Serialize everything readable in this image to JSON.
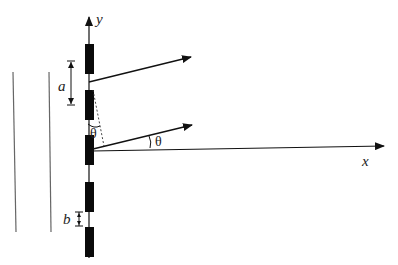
{
  "diagram": {
    "type": "diffraction-grating-geometry",
    "axes": {
      "x_label": "x",
      "y_label": "y"
    },
    "labels": {
      "slit_spacing": "a",
      "slit_width": "b",
      "angle_incident": "θ",
      "angle_between": "θ"
    },
    "slits": {
      "count": 5
    },
    "colors": {
      "stroke": "#111111",
      "block": "#0a0a0a",
      "wall": "#555555"
    }
  }
}
